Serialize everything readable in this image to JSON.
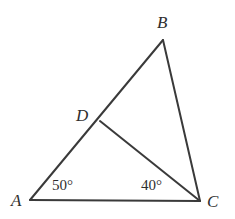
{
  "figure": {
    "type": "geometry-diagram",
    "background_color": "#ffffff",
    "stroke_color": "#3a3a3a",
    "stroke_width": 2,
    "text_color": "#2e2e2e",
    "points": {
      "A": {
        "label": "A",
        "x": 30,
        "y": 200
      },
      "B": {
        "label": "B",
        "x": 163,
        "y": 40
      },
      "C": {
        "label": "C",
        "x": 200,
        "y": 201
      },
      "D": {
        "label": "D",
        "x": 100,
        "y": 121
      }
    },
    "segments": [
      {
        "name": "AB",
        "from": "A",
        "to": "B"
      },
      {
        "name": "BC",
        "from": "B",
        "to": "C"
      },
      {
        "name": "AC",
        "from": "A",
        "to": "C"
      },
      {
        "name": "DC",
        "from": "D",
        "to": "C"
      }
    ],
    "angles": [
      {
        "name": "angle-BAC",
        "vertex": "A",
        "text": "50°",
        "value": 50
      },
      {
        "name": "angle-DCA",
        "vertex": "C",
        "text": "40°",
        "value": 40
      }
    ]
  }
}
